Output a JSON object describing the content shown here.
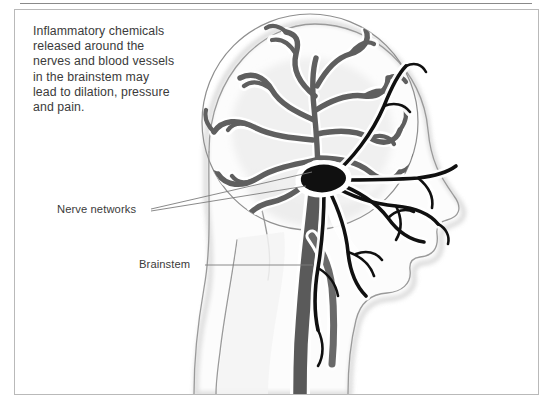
{
  "figure": {
    "type": "medical-illustration",
    "background_color": "#ffffff",
    "border_color": "#b9b9b9",
    "rule_color": "#8a8a8a"
  },
  "caption": {
    "lines": [
      "Inflammatory chemicals",
      "released around the",
      "nerves and blood vessels",
      "in the brainstem may",
      "lead to dilation, pressure",
      "and pain."
    ],
    "text_color": "#3b3b3b"
  },
  "labels": [
    {
      "id": "nerve-networks",
      "text": "Nerve networks"
    },
    {
      "id": "brainstem",
      "text": "Brainstem"
    }
  ],
  "anatomy": {
    "skull_outline_color": "#8f8f8f",
    "head_silhouette_fill": "#fbfbfb",
    "head_silhouette_stroke": "#9a9a9a",
    "brain_tissue_fill": "#f1f1f1",
    "vessel_color": "#5f5f5f",
    "nerve_color": "#101010",
    "brainstem_color": "#5a5a5a",
    "halo_color": "#ffffff",
    "leader_line_color": "#7d7d7d"
  }
}
